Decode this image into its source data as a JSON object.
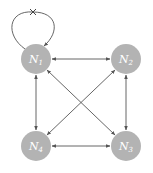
{
  "diagram": {
    "colors": {
      "node_fill": "#b3b3b3",
      "edge": "#555555",
      "label": "#ffffff",
      "background": "#ffffff"
    },
    "nodes": [
      {
        "id": "N1",
        "label": "N",
        "sub": "1",
        "x": 36,
        "y": 59
      },
      {
        "id": "N2",
        "label": "N",
        "sub": "2",
        "x": 126,
        "y": 59
      },
      {
        "id": "N3",
        "label": "N",
        "sub": "3",
        "x": 126,
        "y": 146
      },
      {
        "id": "N4",
        "label": "N",
        "sub": "4",
        "x": 36,
        "y": 146
      }
    ],
    "edges": [
      {
        "from": "N1",
        "to": "N2",
        "type": "bidirectional"
      },
      {
        "from": "N1",
        "to": "N4",
        "type": "bidirectional"
      },
      {
        "from": "N1",
        "to": "N3",
        "type": "bidirectional"
      },
      {
        "from": "N2",
        "to": "N4",
        "type": "bidirectional"
      },
      {
        "from": "N2",
        "to": "N3",
        "type": "bidirectional"
      },
      {
        "from": "N4",
        "to": "N3",
        "type": "bidirectional"
      },
      {
        "from": "N1",
        "to": "N1",
        "type": "self-loop",
        "marker": "x-mark (blocked)"
      }
    ]
  }
}
